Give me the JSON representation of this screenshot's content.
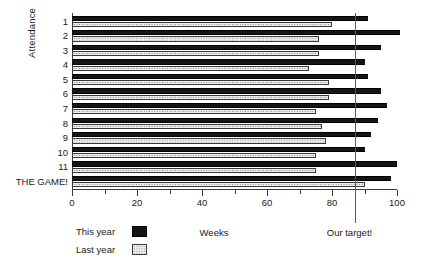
{
  "chart_data": {
    "type": "bar",
    "orientation": "horizontal",
    "title": "",
    "xlabel": "Weeks",
    "ylabel": "Attendance",
    "xlim": [
      0,
      100
    ],
    "ylim": null,
    "grid": false,
    "legend_position": "bottom-left",
    "categories": [
      "1",
      "2",
      "3",
      "4",
      "5",
      "6",
      "7",
      "8",
      "9",
      "10",
      "11",
      "THE GAME!"
    ],
    "tick_labels_x": [
      "0",
      "20",
      "40",
      "60",
      "80",
      "100"
    ],
    "tick_values_x": [
      0,
      20,
      40,
      60,
      80,
      100
    ],
    "minor_tick_values_x": [
      10,
      30,
      50,
      70,
      90
    ],
    "series": [
      {
        "name": "This year",
        "color": "#151515",
        "pattern": "solid-dark",
        "values": [
          91,
          101,
          95,
          90,
          91,
          95,
          97,
          94,
          92,
          90,
          100,
          98
        ]
      },
      {
        "name": "Last year",
        "color": "#eeeeee",
        "pattern": "dotted-light",
        "values": [
          80,
          76,
          76,
          73,
          79,
          79,
          75,
          77,
          78,
          75,
          75,
          90
        ]
      }
    ],
    "annotations": [
      {
        "name": "target-line",
        "label": "Our target!",
        "value": 87,
        "orientation": "vertical",
        "color": "#5a5a5a"
      }
    ]
  },
  "legend": {
    "items": [
      {
        "label": "This year",
        "swatch": "solid-dark-swatch"
      },
      {
        "label": "Last year",
        "swatch": "dotted-light-swatch"
      }
    ]
  }
}
